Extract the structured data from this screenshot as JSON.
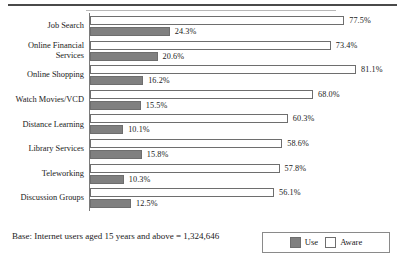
{
  "chart_data": {
    "type": "bar",
    "orientation": "horizontal",
    "title": "",
    "xlabel": "",
    "ylabel": "",
    "xlim": [
      0,
      100
    ],
    "grid": false,
    "legend_position": "bottom-right",
    "categories": [
      "Job Search",
      "Online Financial\nServices",
      "Online Shopping",
      "Watch Movies/VCD",
      "Distance Learning",
      "Library Services",
      "Teleworking",
      "Discussion Groups"
    ],
    "series": [
      {
        "name": "Aware",
        "color": "#ffffff",
        "values": [
          77.5,
          73.4,
          81.1,
          68.0,
          60.3,
          58.6,
          57.8,
          56.1
        ],
        "labels": [
          "77.5%",
          "73.4%",
          "81.1%",
          "68.0%",
          "60.3%",
          "58.6%",
          "57.8%",
          "56.1%"
        ]
      },
      {
        "name": "Use",
        "color": "#808080",
        "values": [
          24.3,
          20.6,
          16.2,
          15.5,
          10.1,
          15.8,
          10.3,
          12.5
        ],
        "labels": [
          "24.3%",
          "20.6%",
          "16.2%",
          "15.5%",
          "10.1%",
          "15.8%",
          "10.3%",
          "12.5%"
        ]
      }
    ]
  },
  "footer": {
    "base_note": "Base: Internet users aged 15 years and above = 1,324,646"
  },
  "legend": {
    "items": [
      {
        "label": "Use",
        "color": "#808080"
      },
      {
        "label": "Aware",
        "color": "#ffffff"
      }
    ]
  }
}
